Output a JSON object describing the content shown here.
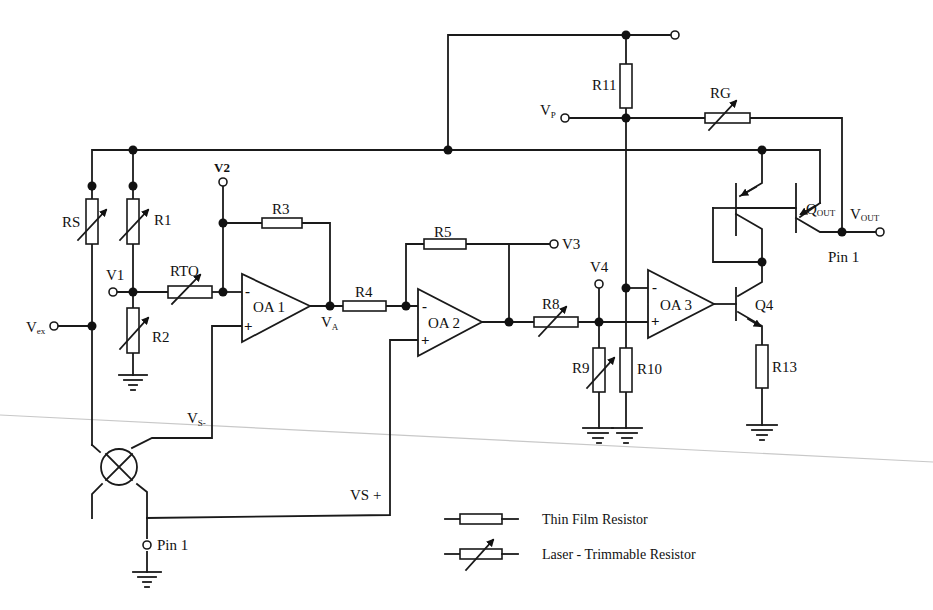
{
  "diagram": {
    "type": "circuit-schematic",
    "labels": {
      "rs": "RS",
      "r1": "R1",
      "r2": "R2",
      "rto": "RTO",
      "r3": "R3",
      "r4": "R4",
      "r5": "R5",
      "r8": "R8",
      "r9": "R9",
      "r10": "R10",
      "r11": "R11",
      "r13": "R13",
      "rg": "RG",
      "oa1": "OA 1",
      "oa2": "OA 2",
      "oa3": "OA 3",
      "q4": "Q4",
      "qout_main": "Q",
      "qout_sub": "OUT",
      "vout_main": "V",
      "vout_sub": "OUT",
      "vp_main": "V",
      "vp_sub": "P",
      "vex_main": "V",
      "vex_sub": "ex",
      "va_main": "V",
      "va_sub": "A",
      "vs_minus_main": "V",
      "vs_minus_sub": "S-",
      "vs_plus": "VS +",
      "v1": "V1",
      "v2": "V2",
      "v3": "V3",
      "v4": "V4",
      "pin1_output": "Pin 1",
      "pin1_ground": "Pin 1",
      "minus": "-",
      "plus": "+"
    },
    "legend": {
      "thin_film": "Thin Film Resistor",
      "laser_trim": "Laser - Trimmable Resistor"
    }
  }
}
